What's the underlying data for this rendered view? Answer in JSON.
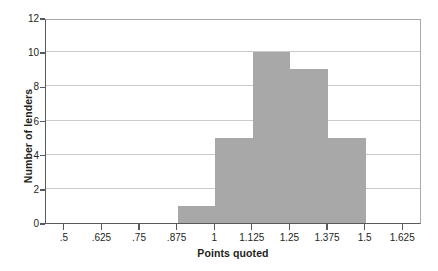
{
  "chart_data": {
    "type": "bar",
    "title": "",
    "xlabel": "Points quoted",
    "ylabel": "Number of lenders",
    "categories": [
      ".5-.625",
      ".625-.75",
      ".75-.875",
      ".875-1",
      "1-1.125",
      "1.125-1.25",
      "1.25-1.375",
      "1.375-1.5",
      "1.5-1.625"
    ],
    "values": [
      0,
      0,
      0,
      1,
      5,
      10,
      9,
      5,
      0
    ],
    "bin_edges": [
      0.5,
      0.625,
      0.75,
      0.875,
      1,
      1.125,
      1.25,
      1.375,
      1.5,
      1.625
    ],
    "x_tick_labels": [
      ".5",
      ".625",
      ".75",
      ".875",
      "1",
      "1.125",
      "1.25",
      "1.375",
      "1.5",
      "1.625"
    ],
    "x_tick_values": [
      0.5,
      0.625,
      0.75,
      0.875,
      1,
      1.125,
      1.25,
      1.375,
      1.5,
      1.625
    ],
    "y_tick_labels": [
      "0",
      "2",
      "4",
      "6",
      "8",
      "10",
      "12"
    ],
    "y_tick_values": [
      0,
      2,
      4,
      6,
      8,
      10,
      12
    ],
    "xlim": [
      0.4375,
      1.6875
    ],
    "ylim": [
      0,
      12
    ],
    "grid": "horizontal",
    "legend": "none",
    "bar_color": "#a8a8a8",
    "gridline_color": "#c9cacc",
    "axis_color": "#58595b",
    "background_color": "#ffffff"
  }
}
